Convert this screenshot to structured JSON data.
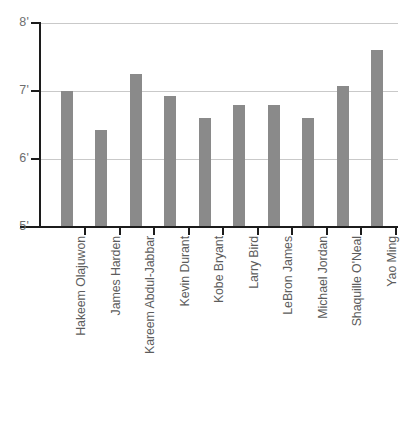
{
  "chart_data": {
    "type": "bar",
    "title": "",
    "subtitle": "",
    "xlabel": "",
    "ylabel": "",
    "categories": [
      "Hakeem Olajuwon",
      "James Harden",
      "Kareem Abdul-Jabbar",
      "Kevin Durant",
      "Kobe Bryant",
      "Larry Bird",
      "LeBron James",
      "Michael Jordan",
      "Shaquille O'Neal",
      "Yao Ming"
    ],
    "values": [
      7.0,
      6.42,
      7.25,
      6.92,
      6.6,
      6.79,
      6.79,
      6.6,
      7.08,
      7.6
    ],
    "value_labels": [
      "7'0\"",
      "6'5\"",
      "7'3\"",
      "6'11\"",
      "6'7\"",
      "6'9\"",
      "6'9\"",
      "6'7\"",
      "7'1\"",
      "7'6\""
    ],
    "ylim": [
      5,
      8
    ],
    "yticks": [
      5,
      6,
      7,
      8
    ],
    "ytick_labels": [
      "5'",
      "6'",
      "7'",
      "8'"
    ],
    "grid": true,
    "legend": false,
    "legend_position": "none",
    "bar_color": "#8a8a8a",
    "gridline_color": "#c9c9c9",
    "axis_color": "#1c1c1c",
    "label_color": "#5c5c5c",
    "tick_label_color": "#6e6e6e"
  }
}
